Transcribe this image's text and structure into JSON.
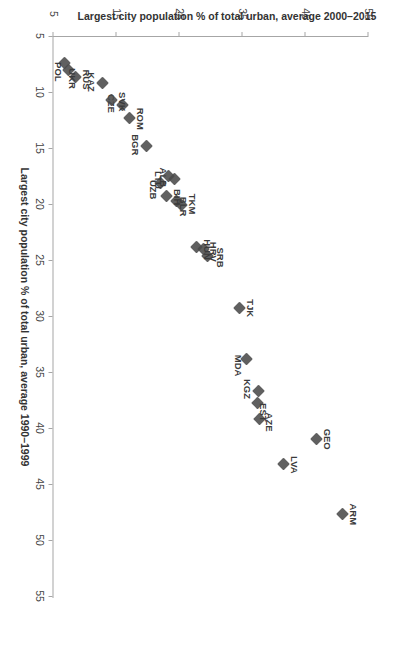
{
  "chart_data": {
    "type": "scatter",
    "title": "",
    "xlabel": "Largest city population % of total urban, average 1990–1999",
    "ylabel": "Largest city population % of total urban, average 2000–2015",
    "xlim": [
      5,
      55
    ],
    "ylim": [
      5,
      55
    ],
    "xticks": [
      5,
      10,
      15,
      20,
      25,
      30,
      35,
      40,
      45,
      50,
      55
    ],
    "yticks": [
      5,
      15,
      25,
      35,
      45,
      55
    ],
    "grid": false,
    "legend": null,
    "marker": {
      "shape": "diamond",
      "color": "#4a4a4a",
      "size": 9
    },
    "points": [
      {
        "label": "ARM",
        "x": 47.7,
        "y": 50.9,
        "label_dx": 0,
        "label_dy": -11
      },
      {
        "label": "GEO",
        "x": 41.0,
        "y": 46.8,
        "label_dx": 0,
        "label_dy": -11
      },
      {
        "label": "LVA",
        "x": 43.2,
        "y": 41.5,
        "label_dx": 1,
        "label_dy": -11
      },
      {
        "label": "AZE",
        "x": 39.2,
        "y": 37.7,
        "label_dx": 3,
        "label_dy": -10
      },
      {
        "label": "EST",
        "x": 37.8,
        "y": 37.4,
        "label_dx": 9,
        "label_dy": -6
      },
      {
        "label": "KGZ",
        "x": 36.7,
        "y": 37.5,
        "label_dx": -2,
        "label_dy": 11
      },
      {
        "label": "MDA",
        "x": 33.8,
        "y": 35.7,
        "label_dx": 7,
        "label_dy": 8
      },
      {
        "label": "TJK",
        "x": 29.3,
        "y": 34.6,
        "label_dx": 0,
        "label_dy": -11
      },
      {
        "label": "SRB",
        "x": 24.6,
        "y": 29.4,
        "label_dx": 2,
        "label_dy": -13
      },
      {
        "label": "HRV",
        "x": 24.0,
        "y": 28.8,
        "label_dx": 3,
        "label_dy": -10
      },
      {
        "label": "HUN",
        "x": 23.8,
        "y": 27.7,
        "label_dx": 3,
        "label_dy": -11
      },
      {
        "label": "TKM",
        "x": 20.1,
        "y": 25.3,
        "label_dx": -1,
        "label_dy": -11
      },
      {
        "label": "BLR",
        "x": 19.7,
        "y": 24.6,
        "label_dx": 6,
        "label_dy": -7
      },
      {
        "label": "BIH",
        "x": 19.3,
        "y": 22.9,
        "label_dx": 1,
        "label_dy": -11
      },
      {
        "label": "UZB",
        "x": 18.1,
        "y": 22.0,
        "label_dx": 7,
        "label_dy": 7
      },
      {
        "label": "ALB",
        "x": 17.8,
        "y": 24.2,
        "label_dx": -2,
        "label_dy": 11
      },
      {
        "label": "LTU",
        "x": 17.5,
        "y": 23.2,
        "label_dx": 4,
        "label_dy": 10
      },
      {
        "label": "BGR",
        "x": 14.8,
        "y": 19.8,
        "label_dx": -1,
        "label_dy": 11
      },
      {
        "label": "ROM",
        "x": 12.3,
        "y": 17.0,
        "label_dx": 1,
        "label_dy": -11
      },
      {
        "label": "CZE",
        "x": 11.2,
        "y": 16.0,
        "label_dx": -2,
        "label_dy": 11
      },
      {
        "label": "SVK",
        "x": 10.7,
        "y": 14.2,
        "label_dx": 2,
        "label_dy": -11
      },
      {
        "label": "KAZ",
        "x": 9.2,
        "y": 12.7,
        "label_dx": -1,
        "label_dy": 11
      },
      {
        "label": "RUS",
        "x": 8.7,
        "y": 8.5,
        "label_dx": 2,
        "label_dy": -11
      },
      {
        "label": "UKR",
        "x": 8.0,
        "y": 7.4,
        "label_dx": 9,
        "label_dy": -4
      },
      {
        "label": "POL",
        "x": 7.4,
        "y": 6.8,
        "label_dx": 9,
        "label_dy": 6
      }
    ]
  },
  "axes": {
    "x_title": "Largest city population % of total urban, average 1990–1999",
    "y_title": "Largest city population % of total urban, average 2000–2015",
    "x_tick_labels": [
      "5",
      "10",
      "15",
      "20",
      "25",
      "30",
      "35",
      "40",
      "45",
      "50",
      "55"
    ],
    "y_tick_labels": [
      "5",
      "15",
      "25",
      "35",
      "45",
      "55"
    ],
    "axis_color": "#a6a6a6"
  }
}
